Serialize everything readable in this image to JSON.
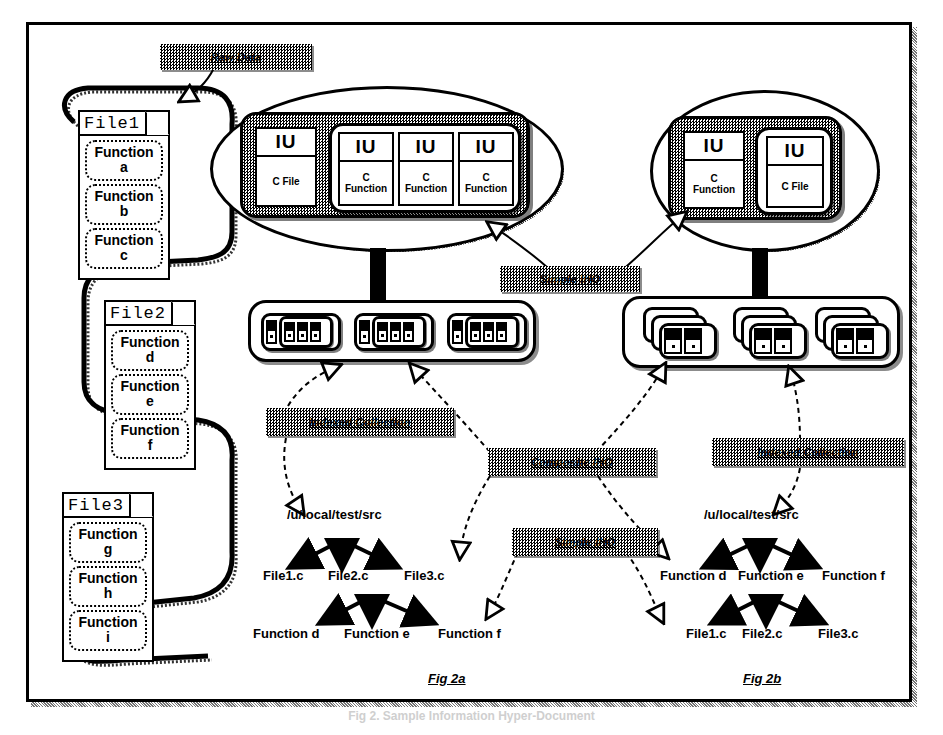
{
  "figure": {
    "caption": "Fig 2. Sample Information Hyper-Document",
    "panel_a_label": "Fig 2a",
    "panel_b_label": "Fig 2b"
  },
  "callouts": {
    "raw_data": "Raw Data",
    "simple_iho_top": "Simple IHO",
    "indexed_collection_left": "Indexed Collection",
    "composite_iho": "Composite IHO",
    "simple_iho_bottom": "Simple IHO",
    "indexed_collection_right": "Indexed Collection"
  },
  "raw_data": {
    "files": [
      {
        "name": "File1",
        "functions": [
          "Function\na",
          "Function\nb",
          "Function\nc"
        ]
      },
      {
        "name": "File2",
        "functions": [
          "Function\nd",
          "Function\ne",
          "Function\nf"
        ]
      },
      {
        "name": "File3",
        "functions": [
          "Function\ng",
          "Function\nh",
          "Function\ni"
        ]
      }
    ]
  },
  "simple_iho_a": {
    "root_unit": {
      "header": "IU",
      "body": "C File"
    },
    "child_units": [
      {
        "header": "IU",
        "body": "C\nFunction"
      },
      {
        "header": "IU",
        "body": "C\nFunction"
      },
      {
        "header": "IU",
        "body": "C\nFunction"
      }
    ]
  },
  "simple_iho_b": {
    "root_unit": {
      "header": "IU",
      "body": "C\nFunction"
    },
    "child_units": [
      {
        "header": "IU",
        "body": "C File"
      }
    ]
  },
  "collection_a": {
    "item_count": 3
  },
  "collection_b": {
    "item_count": 3
  },
  "tree_a": {
    "root": "/u/local/test/src",
    "level1": [
      "File1.c",
      "File2.c",
      "File3.c"
    ],
    "level2_parent": "File2.c",
    "level2": [
      "Function d",
      "Function e",
      "Function f"
    ]
  },
  "tree_b": {
    "root": "/u/local/test/src",
    "level1": [
      "Function d",
      "Function e",
      "Function f"
    ],
    "level2_parent": "Function e",
    "level2": [
      "File1.c",
      "File2.c",
      "File3.c"
    ]
  },
  "colors": {
    "ink": "#000000",
    "paper": "#ffffff",
    "halftone": "#808080"
  }
}
